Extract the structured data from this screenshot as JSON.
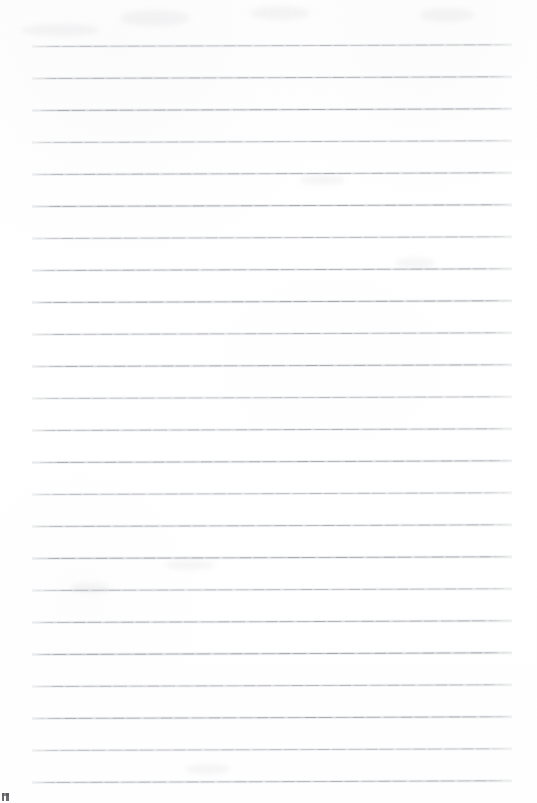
{
  "document": {
    "kind": "scanned-lined-paper",
    "title": "Blank ruled notebook page",
    "page_width": 537,
    "page_height": 803,
    "background_color": "#ffffff",
    "written_content": "",
    "rule": {
      "color": "#84889220",
      "stroke_color": "#848892",
      "line_count": 24,
      "first_line_y": 46,
      "line_spacing": 32,
      "left_x": 32,
      "right_x": 512,
      "thickness": 1,
      "skew_degrees": -0.2,
      "line_y_positions": [
        46,
        78,
        110,
        142,
        174,
        206,
        238,
        270,
        302,
        334,
        366,
        398,
        430,
        462,
        494,
        526,
        558,
        590,
        622,
        654,
        686,
        718,
        750,
        782
      ]
    },
    "margins": {
      "top": 46,
      "bottom": 21,
      "left": 32,
      "right": 25
    },
    "artifacts": [
      {
        "name": "corner-speck",
        "x": 2,
        "y": 793,
        "width": 7,
        "height": 8,
        "color": "#3c3c40"
      }
    ],
    "smudges": [
      {
        "x": 120,
        "y": 10,
        "w": 70,
        "h": 16
      },
      {
        "x": 250,
        "y": 6,
        "w": 60,
        "h": 14
      },
      {
        "x": 420,
        "y": 8,
        "w": 55,
        "h": 14
      },
      {
        "x": 20,
        "y": 24,
        "w": 80,
        "h": 12
      },
      {
        "x": 70,
        "y": 583,
        "w": 40,
        "h": 10
      },
      {
        "x": 165,
        "y": 560,
        "w": 50,
        "h": 10
      },
      {
        "x": 300,
        "y": 175,
        "w": 45,
        "h": 10
      },
      {
        "x": 395,
        "y": 258,
        "w": 40,
        "h": 10
      },
      {
        "x": 185,
        "y": 764,
        "w": 45,
        "h": 10
      }
    ]
  }
}
